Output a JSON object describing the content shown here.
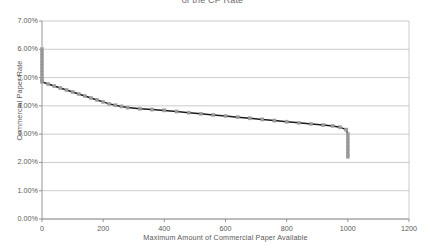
{
  "chart_data": {
    "type": "line",
    "title": "of the CP Rate",
    "xlabel": "Maximum Amount of Commercial Paper Available",
    "ylabel": "Commercial Paper Rate",
    "xlim": [
      0,
      1200
    ],
    "ylim": [
      0,
      0.07
    ],
    "xticks": [
      0,
      200,
      400,
      600,
      800,
      1000,
      1200
    ],
    "xticklabels": [
      "0",
      "200",
      "400",
      "600",
      "800",
      "1000",
      "1200"
    ],
    "yticks": [
      0,
      0.01,
      0.02,
      0.03,
      0.04,
      0.05,
      0.06,
      0.07
    ],
    "yticklabels": [
      "0.00%",
      "1.00%",
      "2.00%",
      "3.00%",
      "4.00%",
      "5.00%",
      "6.00%",
      "7.00%"
    ],
    "grid": "horizontal",
    "legend": "none",
    "series": [
      {
        "name": "Commercial Paper Supply Curve",
        "marker": "square",
        "marker_color": "#9a9a9a",
        "line_color": "#1a1a1a",
        "points": [
          {
            "x": 0,
            "y": 0.06
          },
          {
            "x": 0,
            "y": 0.0588
          },
          {
            "x": 0,
            "y": 0.0576
          },
          {
            "x": 0,
            "y": 0.0564
          },
          {
            "x": 0,
            "y": 0.0552
          },
          {
            "x": 0,
            "y": 0.054
          },
          {
            "x": 0,
            "y": 0.0528
          },
          {
            "x": 0,
            "y": 0.0516
          },
          {
            "x": 0,
            "y": 0.0505
          },
          {
            "x": 0,
            "y": 0.0496
          },
          {
            "x": 0,
            "y": 0.049
          },
          {
            "x": 0,
            "y": 0.0485
          },
          {
            "x": 20,
            "y": 0.0477
          },
          {
            "x": 40,
            "y": 0.047
          },
          {
            "x": 60,
            "y": 0.0463
          },
          {
            "x": 80,
            "y": 0.0456
          },
          {
            "x": 100,
            "y": 0.0449
          },
          {
            "x": 120,
            "y": 0.0442
          },
          {
            "x": 140,
            "y": 0.0435
          },
          {
            "x": 160,
            "y": 0.0428
          },
          {
            "x": 180,
            "y": 0.0421
          },
          {
            "x": 200,
            "y": 0.0414
          },
          {
            "x": 220,
            "y": 0.0407
          },
          {
            "x": 240,
            "y": 0.0402
          },
          {
            "x": 260,
            "y": 0.0398
          },
          {
            "x": 280,
            "y": 0.0394
          },
          {
            "x": 320,
            "y": 0.039
          },
          {
            "x": 360,
            "y": 0.0387
          },
          {
            "x": 400,
            "y": 0.0384
          },
          {
            "x": 440,
            "y": 0.038
          },
          {
            "x": 480,
            "y": 0.0376
          },
          {
            "x": 520,
            "y": 0.0372
          },
          {
            "x": 560,
            "y": 0.0368
          },
          {
            "x": 600,
            "y": 0.0364
          },
          {
            "x": 640,
            "y": 0.036
          },
          {
            "x": 680,
            "y": 0.0356
          },
          {
            "x": 720,
            "y": 0.0352
          },
          {
            "x": 760,
            "y": 0.0348
          },
          {
            "x": 800,
            "y": 0.0344
          },
          {
            "x": 840,
            "y": 0.034
          },
          {
            "x": 880,
            "y": 0.0336
          },
          {
            "x": 920,
            "y": 0.0332
          },
          {
            "x": 950,
            "y": 0.0329
          },
          {
            "x": 975,
            "y": 0.0324
          },
          {
            "x": 995,
            "y": 0.0316
          },
          {
            "x": 1000,
            "y": 0.03
          },
          {
            "x": 1000,
            "y": 0.0288
          },
          {
            "x": 1000,
            "y": 0.0276
          },
          {
            "x": 1000,
            "y": 0.0264
          },
          {
            "x": 1000,
            "y": 0.0252
          },
          {
            "x": 1000,
            "y": 0.024
          },
          {
            "x": 1000,
            "y": 0.0228
          },
          {
            "x": 1000,
            "y": 0.022
          }
        ]
      }
    ],
    "colors": {
      "line": "#1a1a1a",
      "marker": "#9a9a9a",
      "grid": "#b5b5b5",
      "axis": "#8a8a8a",
      "text": "#595959",
      "background": "#ffffff"
    }
  }
}
